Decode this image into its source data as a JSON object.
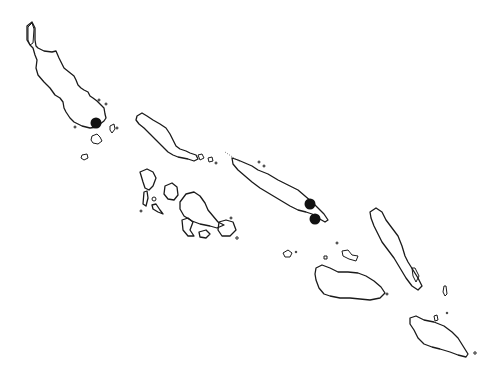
{
  "map": {
    "style": "outline",
    "background": "#ffffff",
    "stroke_color": "#1a1a1a",
    "marker_color": "#111111",
    "islands": [
      {
        "id": "bougainville",
        "label": ""
      },
      {
        "id": "choiseul",
        "label": ""
      },
      {
        "id": "santa-isabel",
        "label": ""
      },
      {
        "id": "new-georgia-group",
        "label": ""
      },
      {
        "id": "malaita",
        "label": ""
      },
      {
        "id": "guadalcanal",
        "label": ""
      },
      {
        "id": "makira",
        "label": ""
      }
    ],
    "markers": [
      {
        "id": "marker-1",
        "x": 96,
        "y": 123,
        "r": 5.5
      },
      {
        "id": "marker-2",
        "x": 310,
        "y": 204,
        "r": 5.5
      },
      {
        "id": "marker-3",
        "x": 315,
        "y": 219,
        "r": 5.5
      }
    ]
  }
}
